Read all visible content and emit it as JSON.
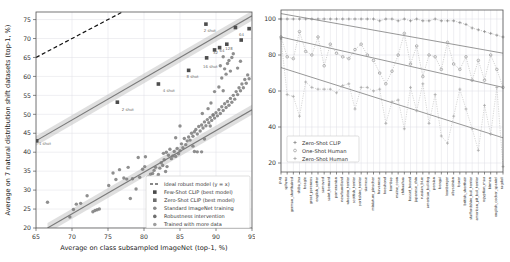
{
  "chart_data": [
    {
      "id": "left",
      "type": "scatter",
      "title": "",
      "xlabel": "Average on class subsampled ImageNet (top-1, %)",
      "ylabel": "Average on 7 natural distribution shift datasets (top-1, %)",
      "xlim": [
        65,
        95
      ],
      "ylim": [
        20,
        77
      ],
      "xticks": [
        65,
        70,
        75,
        80,
        85,
        90,
        95
      ],
      "yticks": [
        20,
        25,
        30,
        35,
        40,
        45,
        50,
        55,
        60,
        65,
        70,
        75
      ],
      "grid": true,
      "legend_position": "lower-right",
      "legend": [
        {
          "label": "Ideal robust model (y = x)",
          "marker": "dashed-line",
          "color": "#111111"
        },
        {
          "label": "Few-Shot CLIP (best model)",
          "marker": "square",
          "color": "#4a4a4a"
        },
        {
          "label": "Zero-Shot CLIP (best model)",
          "marker": "square",
          "color": "#6e6e6e"
        },
        {
          "label": "Standard ImageNet training",
          "marker": "circle",
          "color": "#8a8a8a"
        },
        {
          "label": "Robustness intervention",
          "marker": "circle",
          "color": "#6e6e6e"
        },
        {
          "label": "Trained with more data",
          "marker": "circle",
          "color": "#9e9e9e"
        }
      ],
      "annotations": [
        {
          "text": "1 shot",
          "x": 65.4,
          "y": 42.0
        },
        {
          "text": "2 shot",
          "x": 76.9,
          "y": 51.0
        },
        {
          "text": "4 shot",
          "x": 82.6,
          "y": 56.0
        },
        {
          "text": "8 shot",
          "x": 85.9,
          "y": 59.6
        },
        {
          "text": "16 shot",
          "x": 88.2,
          "y": 62.2
        },
        {
          "text": "32",
          "x": 89.6,
          "y": 66.0
        },
        {
          "text": "64",
          "x": 90.5,
          "y": 66.4
        },
        {
          "text": "128",
          "x": 91.3,
          "y": 67.1
        },
        {
          "text": "64",
          "x": 93.2,
          "y": 70.6
        },
        {
          "text": "2 shot",
          "x": 88.3,
          "y": 71.6
        }
      ],
      "ideal_line": {
        "label": "y = x",
        "from": [
          65,
          65
        ],
        "to": [
          77,
          77
        ]
      },
      "fewshot_points": [
        [
          65.1,
          43.0
        ],
        [
          76.3,
          53.2
        ],
        [
          82.0,
          58.0
        ],
        [
          86.2,
          61.6
        ],
        [
          88.7,
          64.9
        ],
        [
          89.8,
          67.0
        ],
        [
          90.5,
          67.6
        ],
        [
          91.5,
          68.5
        ],
        [
          92.7,
          72.9
        ],
        [
          88.6,
          73.8
        ],
        [
          93.5,
          69.6
        ],
        [
          94.6,
          72.6
        ]
      ],
      "fit_upper": {
        "from": [
          65,
          43.0
        ],
        "to": [
          95,
          76.0
        ]
      },
      "fit_lower": {
        "from": [
          66.6,
          20.0
        ],
        "to": [
          95,
          51.2
        ]
      },
      "scatter_points": [
        [
          66.6,
          26.8
        ],
        [
          69.7,
          22.9
        ],
        [
          70.2,
          24.9
        ],
        [
          70.6,
          26.3
        ],
        [
          71.2,
          26.5
        ],
        [
          72.1,
          28.5
        ],
        [
          72.9,
          24.3
        ],
        [
          73.2,
          24.6
        ],
        [
          73.5,
          24.8
        ],
        [
          73.8,
          25.0
        ],
        [
          75.1,
          31.2
        ],
        [
          75.7,
          34.5
        ],
        [
          76.1,
          32.8
        ],
        [
          76.6,
          35.4
        ],
        [
          77.2,
          33.2
        ],
        [
          77.6,
          32.9
        ],
        [
          78.1,
          27.8
        ],
        [
          78.4,
          33.0
        ],
        [
          78.9,
          30.3
        ],
        [
          79.4,
          33.4
        ],
        [
          79.8,
          35.5
        ],
        [
          80.2,
          38.8
        ],
        [
          80.6,
          33.5
        ],
        [
          80.9,
          34.2
        ],
        [
          81.2,
          34.4
        ],
        [
          81.4,
          35.2
        ],
        [
          81.6,
          36.0
        ],
        [
          81.8,
          33.4
        ],
        [
          82.0,
          34.1
        ],
        [
          82.2,
          35.8
        ],
        [
          82.4,
          37.2
        ],
        [
          82.6,
          36.5
        ],
        [
          82.8,
          38.0
        ],
        [
          83.0,
          34.9
        ],
        [
          83.2,
          36.2
        ],
        [
          83.4,
          39.2
        ],
        [
          83.6,
          40.8
        ],
        [
          83.8,
          38.3
        ],
        [
          84.0,
          39.0
        ],
        [
          84.2,
          40.2
        ],
        [
          84.4,
          38.9
        ],
        [
          84.6,
          41.0
        ],
        [
          84.8,
          39.6
        ],
        [
          85.0,
          40.4
        ],
        [
          85.2,
          42.2
        ],
        [
          85.4,
          41.2
        ],
        [
          85.6,
          43.6
        ],
        [
          85.8,
          42.0
        ],
        [
          86.0,
          43.0
        ],
        [
          86.2,
          44.0
        ],
        [
          86.4,
          43.2
        ],
        [
          86.6,
          45.0
        ],
        [
          86.8,
          44.2
        ],
        [
          87.0,
          45.4
        ],
        [
          87.2,
          46.0
        ],
        [
          87.4,
          44.8
        ],
        [
          87.6,
          46.8
        ],
        [
          87.8,
          45.6
        ],
        [
          88.0,
          47.2
        ],
        [
          88.2,
          46.4
        ],
        [
          88.4,
          48.0
        ],
        [
          88.6,
          47.0
        ],
        [
          88.8,
          48.6
        ],
        [
          89.0,
          47.8
        ],
        [
          89.2,
          49.2
        ],
        [
          89.4,
          48.4
        ],
        [
          89.6,
          49.8
        ],
        [
          89.8,
          49.0
        ],
        [
          90.0,
          50.4
        ],
        [
          90.2,
          49.6
        ],
        [
          90.4,
          51.2
        ],
        [
          90.6,
          50.2
        ],
        [
          90.8,
          52.0
        ],
        [
          91.0,
          51.0
        ],
        [
          91.2,
          52.8
        ],
        [
          91.4,
          51.8
        ],
        [
          91.6,
          53.4
        ],
        [
          91.8,
          52.4
        ],
        [
          92.0,
          54.2
        ],
        [
          92.2,
          53.2
        ],
        [
          92.4,
          55.0
        ],
        [
          92.6,
          54.0
        ],
        [
          92.8,
          56.0
        ],
        [
          93.0,
          55.2
        ],
        [
          93.2,
          57.0
        ],
        [
          93.4,
          56.2
        ],
        [
          93.6,
          58.0
        ],
        [
          93.8,
          57.0
        ],
        [
          94.0,
          59.2
        ],
        [
          94.2,
          58.2
        ],
        [
          94.4,
          60.4
        ],
        [
          94.6,
          59.4
        ],
        [
          86.8,
          41.6
        ],
        [
          87.0,
          40.2
        ],
        [
          87.4,
          40.1
        ],
        [
          88.0,
          40.1
        ],
        [
          88.4,
          43.5
        ],
        [
          89.2,
          46.9
        ],
        [
          89.6,
          49.8
        ],
        [
          90.4,
          57.2
        ],
        [
          90.8,
          59.6
        ],
        [
          91.0,
          56.2
        ],
        [
          91.2,
          62.0
        ],
        [
          91.4,
          60.6
        ],
        [
          91.6,
          63.4
        ],
        [
          91.8,
          64.2
        ],
        [
          92.0,
          61.4
        ],
        [
          92.2,
          65.0
        ],
        [
          92.4,
          66.0
        ],
        [
          91.0,
          65.2
        ],
        [
          90.6,
          62.8
        ],
        [
          89.3,
          53.0
        ],
        [
          88.9,
          51.5
        ],
        [
          88.1,
          50.2
        ],
        [
          85.0,
          46.9
        ],
        [
          84.4,
          43.8
        ],
        [
          83.1,
          40.0
        ],
        [
          82.7,
          39.7
        ],
        [
          80.1,
          36.2
        ],
        [
          79.2,
          38.6
        ],
        [
          77.8,
          36.0
        ],
        [
          93.0,
          62.2
        ],
        [
          93.4,
          64.0
        ],
        [
          89.8,
          56.0
        ]
      ]
    },
    {
      "id": "right",
      "type": "line",
      "title": "",
      "xlabel": "",
      "ylabel": "",
      "ylim": [
        15,
        105
      ],
      "yticks": [
        20,
        40,
        60,
        80,
        100
      ],
      "grid": true,
      "legend_position": "lower-left",
      "legend": [
        {
          "label": "Zero-Shot CLIP",
          "color": "#8a8a8a",
          "marker": "plus"
        },
        {
          "label": "One-Shot Human",
          "color": "#9a9a9a",
          "marker": "circle"
        },
        {
          "label": "Zero-Shot Human",
          "color": "#a6a6a6",
          "marker": "plus"
        }
      ],
      "categories": [
        "pug",
        "sphynx",
        "german_shorthaired",
        "shiba_inu",
        "beagle",
        "great_pyrenees",
        "english_setter",
        "samoyed",
        "saint_bernard",
        "pomeranian",
        "newfoundland",
        "wheaten_terrier",
        "scottish_terrier",
        "yorkshire_terrier",
        "siamese",
        "miniature_pinscher",
        "havanese",
        "keeshond",
        "bombay",
        "maine_coon",
        "chihuahua",
        "basset_hound",
        "japanese_chin",
        "russian_blue",
        "american_bulldog",
        "persian",
        "bengal",
        "leonberger",
        "abyssinian",
        "boxer",
        "british_shorthair",
        "staffordshire_bull_terrier",
        "american_pit_bull_terrier",
        "egyptian_mau",
        "birman",
        "english_cocker_spaniel",
        "ragdoll"
      ],
      "series": [
        {
          "name": "Zero-Shot CLIP",
          "values": [
            100,
            100,
            100,
            100,
            100,
            100,
            100,
            100,
            100,
            100,
            100,
            100,
            100,
            100,
            100,
            100,
            99,
            100,
            100,
            99,
            100,
            99,
            100,
            99,
            99,
            100,
            99,
            99,
            99,
            98,
            97,
            95,
            94,
            93,
            92,
            91,
            90
          ]
        },
        {
          "name": "One-Shot Human",
          "values": [
            90,
            79,
            78,
            93,
            82,
            80,
            90,
            74,
            86,
            81,
            79,
            78,
            83,
            86,
            80,
            77,
            70,
            64,
            71,
            80,
            92,
            75,
            85,
            68,
            80,
            79,
            72,
            87,
            75,
            72,
            79,
            66,
            77,
            66,
            80,
            72,
            62
          ]
        },
        {
          "name": "Zero-Shot Human",
          "values": [
            89,
            58,
            57,
            46,
            65,
            62,
            61,
            61,
            61,
            59,
            63,
            64,
            50,
            62,
            62,
            60,
            61,
            42,
            54,
            55,
            39,
            62,
            49,
            64,
            42,
            58,
            35,
            31,
            46,
            61,
            50,
            39,
            27,
            52,
            36,
            62,
            18
          ]
        }
      ],
      "trend_lines": [
        {
          "name": "clip-trend",
          "from": [
            0,
            103
          ],
          "to": [
            36,
            81
          ]
        },
        {
          "name": "oneshot-trend",
          "from": [
            0,
            90
          ],
          "to": [
            36,
            62
          ]
        },
        {
          "name": "zeroshot-trend",
          "from": [
            0,
            73
          ],
          "to": [
            36,
            34
          ]
        }
      ]
    }
  ]
}
